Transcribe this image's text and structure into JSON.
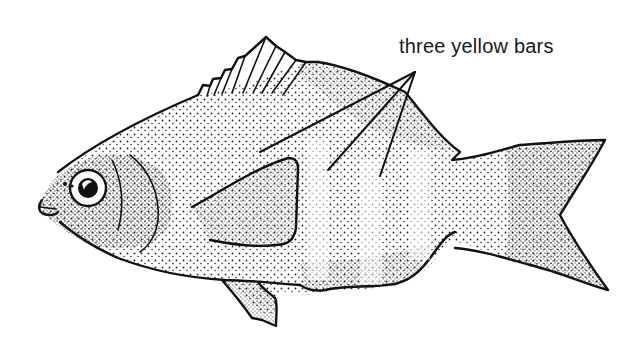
{
  "figure": {
    "annotation": {
      "label": "three yellow bars",
      "leader_count": 3
    },
    "colors": {
      "ink": "#111111",
      "background": "#ffffff"
    }
  }
}
